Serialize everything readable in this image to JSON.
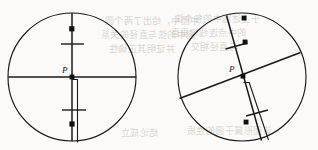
{
  "figure": {
    "background_color": "#fbfaf8",
    "stroke_color": "#1a1a1a",
    "labels": {
      "left_point_p": "P",
      "right_point_p": "P"
    },
    "left_circle": {
      "name": "left-circle",
      "center_x": 72,
      "center_y": 77,
      "radius": 64,
      "chords": [
        {
          "name": "vertical-diameter",
          "x1": 72,
          "y1": 13,
          "x2": 72,
          "y2": 141
        },
        {
          "name": "horizontal-diameter",
          "x1": 8,
          "y1": 77,
          "x2": 136,
          "y2": 77
        },
        {
          "name": "parallel-sliver",
          "x1": 77,
          "y1": 82,
          "x2": 77,
          "y2": 142
        }
      ],
      "tick_marks": [
        {
          "name": "tick-upper",
          "cx": 72,
          "cy": 44,
          "angle": 0
        },
        {
          "name": "tick-lower",
          "cx": 74,
          "cy": 110,
          "angle": 0
        }
      ],
      "dots": [
        {
          "name": "dot-upper",
          "cx": 72,
          "cy": 29
        },
        {
          "name": "dot-lower",
          "cx": 72,
          "cy": 124
        }
      ],
      "point_p": {
        "x": 72,
        "y": 77,
        "label_x": 62,
        "label_y": 71
      }
    },
    "right_circle": {
      "name": "right-circle",
      "center_x": 242,
      "center_y": 77,
      "radius": 64,
      "chords": [
        {
          "name": "steep-chord",
          "x1": 227,
          "y1": 16,
          "x2": 261,
          "y2": 140
        },
        {
          "name": "shallow-chord",
          "x1": 180,
          "y1": 99,
          "x2": 300,
          "y2": 53
        },
        {
          "name": "parallel-sliver",
          "x1": 249,
          "y1": 85,
          "x2": 268,
          "y2": 139
        }
      ],
      "tick_marks": [
        {
          "name": "tick-upper",
          "cx": 236,
          "cy": 46,
          "angle": 15
        },
        {
          "name": "tick-lower",
          "cx": 256,
          "cy": 113,
          "angle": 15
        }
      ],
      "dots": [
        {
          "name": "dot-top",
          "cx": 244,
          "cy": 18
        },
        {
          "name": "dot-mid",
          "cx": 245,
          "cy": 42
        },
        {
          "name": "dot-bottom",
          "cx": 246,
          "cy": 122
        }
      ],
      "point_p": {
        "x": 243,
        "y": 76,
        "label_x": 229,
        "label_y": 70
      }
    },
    "bleed_through_lines": [
      {
        "text": "中图中，给出了两个圆",
        "x": 104,
        "y": 22,
        "size": 9
      },
      {
        "text": "圆中的弦与直径的关系",
        "x": 100,
        "y": 36,
        "size": 9
      },
      {
        "text": "并证明其正确性",
        "x": 108,
        "y": 50,
        "size": 9
      },
      {
        "text": "于上述圆中的各个弦",
        "x": 174,
        "y": 20,
        "size": 9
      },
      {
        "text": "的中点连线均垂直",
        "x": 170,
        "y": 34,
        "size": 9
      },
      {
        "text": "与直径相交",
        "x": 190,
        "y": 48,
        "size": 9
      },
      {
        "text": "该图形属于圆的性质",
        "x": 186,
        "y": 132,
        "size": 9
      },
      {
        "text": "结论成立",
        "x": 120,
        "y": 134,
        "size": 9
      }
    ]
  }
}
